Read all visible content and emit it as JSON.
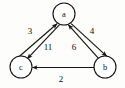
{
  "diagram": {
    "background_color": "#fdfdfb",
    "stroke_color": "#151515",
    "node_fill": "#ffffff",
    "nodes": [
      {
        "id": "a",
        "label": "a",
        "cx": 64,
        "cy": 14,
        "r": 11
      },
      {
        "id": "c",
        "label": "c",
        "cx": 21,
        "cy": 67,
        "r": 11
      },
      {
        "id": "b",
        "label": "b",
        "cx": 105,
        "cy": 67,
        "r": 11
      }
    ],
    "edges": [
      {
        "id": "c-to-a",
        "from": "c",
        "to": "a",
        "weight": "3",
        "label_x": 30,
        "label_y": 31,
        "x1": 19.5,
        "y1": 56.2,
        "x2": 57.0,
        "y2": 23.8
      },
      {
        "id": "a-to-c",
        "from": "a",
        "to": "c",
        "weight": "11",
        "label_x": 48,
        "label_y": 47,
        "x1": 59.6,
        "y1": 24.6,
        "x2": 27.4,
        "y2": 58.6
      },
      {
        "id": "b-to-a",
        "from": "b",
        "to": "a",
        "weight": "6",
        "label_x": 74,
        "label_y": 47,
        "x1": 98.7,
        "y1": 58.6,
        "x2": 68.4,
        "y2": 24.8
      },
      {
        "id": "a-to-b",
        "from": "a",
        "to": "b",
        "weight": "4",
        "label_x": 92,
        "label_y": 31,
        "x1": 71.2,
        "y1": 23.6,
        "x2": 106.6,
        "y2": 56.2
      },
      {
        "id": "b-to-c",
        "from": "b",
        "to": "c",
        "weight": "2",
        "label_x": 61,
        "label_y": 79,
        "x1": 94.0,
        "y1": 67.5,
        "x2": 32.5,
        "y2": 67.5
      }
    ]
  }
}
